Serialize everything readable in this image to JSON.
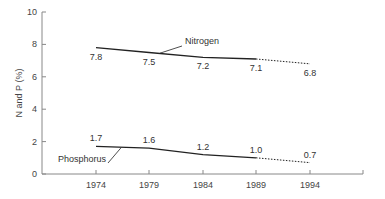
{
  "chart_data": {
    "type": "line",
    "title": "",
    "xlabel": "",
    "ylabel": "N and P (%)",
    "ylim": [
      0,
      10
    ],
    "yticks": [
      0,
      2,
      4,
      6,
      8,
      10
    ],
    "categories": [
      "1974",
      "1979",
      "1984",
      "1989",
      "1994"
    ],
    "grid": false,
    "legend": "inline labels",
    "series": [
      {
        "name": "Nitrogen",
        "values": [
          7.8,
          7.5,
          7.2,
          7.1,
          6.8
        ],
        "labels": [
          "7.8",
          "7.5",
          "7.2",
          "7.1",
          "6.8"
        ],
        "note": "1989–1994 segment dotted (projection)"
      },
      {
        "name": "Phosphorus",
        "values": [
          1.7,
          1.6,
          1.2,
          1.0,
          0.7
        ],
        "labels": [
          "1.7",
          "1.6",
          "1.2",
          "1.0",
          "0.7"
        ],
        "note": "1989–1994 segment dotted (projection)"
      }
    ]
  },
  "colors": {
    "axis": "#888888",
    "line": "#222222",
    "text": "#444444"
  }
}
